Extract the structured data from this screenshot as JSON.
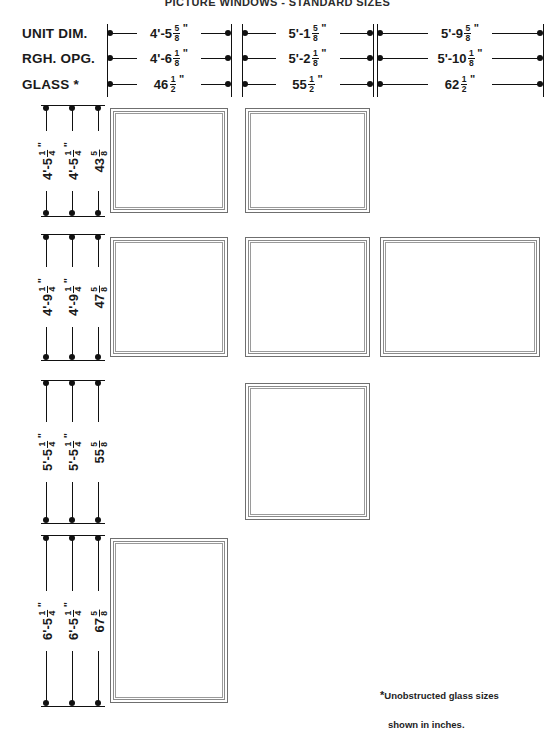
{
  "title": "PICTURE WINDOWS - STANDARD SIZES",
  "row_labels": {
    "unit_dim": "UNIT DIM.",
    "rgh_opg": "RGH. OPG.",
    "glass": "GLASS *"
  },
  "footnote": {
    "star": "*",
    "line1": "Unobstructed glass sizes",
    "line2": "shown in inches."
  },
  "columns": [
    {
      "id": "col-1",
      "unit_dim": {
        "feet": "4'-5",
        "num": "5",
        "den": "8",
        "mark": "\""
      },
      "rgh_opg": {
        "feet": "4'-6",
        "num": "1",
        "den": "8",
        "mark": "\""
      },
      "glass": {
        "feet": "46",
        "num": "1",
        "den": "2",
        "mark": "\""
      }
    },
    {
      "id": "col-2",
      "unit_dim": {
        "feet": "5'-1",
        "num": "5",
        "den": "8",
        "mark": "\""
      },
      "rgh_opg": {
        "feet": "5'-2",
        "num": "1",
        "den": "8",
        "mark": "\""
      },
      "glass": {
        "feet": "55",
        "num": "1",
        "den": "2",
        "mark": "\""
      }
    },
    {
      "id": "col-3",
      "unit_dim": {
        "feet": "5'-9",
        "num": "5",
        "den": "8",
        "mark": "\""
      },
      "rgh_opg": {
        "feet": "5'-10",
        "num": "1",
        "den": "8",
        "mark": "\""
      },
      "glass": {
        "feet": "62",
        "num": "1",
        "den": "2",
        "mark": "\""
      }
    }
  ],
  "rows": [
    {
      "id": "row-1",
      "unit_dim": {
        "feet": "4'-5",
        "num": "1",
        "den": "4",
        "mark": "\""
      },
      "rgh_opg": {
        "feet": "4'-5",
        "num": "1",
        "den": "4",
        "mark": "\""
      },
      "glass": {
        "feet": "43",
        "num": "5",
        "den": "8",
        "mark": ""
      },
      "boxes": [
        true,
        true,
        false
      ]
    },
    {
      "id": "row-2",
      "unit_dim": {
        "feet": "4'-9",
        "num": "1",
        "den": "4",
        "mark": "\""
      },
      "rgh_opg": {
        "feet": "4'-9",
        "num": "1",
        "den": "4",
        "mark": "\""
      },
      "glass": {
        "feet": "47",
        "num": "5",
        "den": "8",
        "mark": ""
      },
      "boxes": [
        true,
        true,
        true
      ]
    },
    {
      "id": "row-3",
      "unit_dim": {
        "feet": "5'-5",
        "num": "1",
        "den": "4",
        "mark": "\""
      },
      "rgh_opg": {
        "feet": "5'-5",
        "num": "1",
        "den": "4",
        "mark": "\""
      },
      "glass": {
        "feet": "55",
        "num": "5",
        "den": "8",
        "mark": ""
      },
      "boxes": [
        false,
        true,
        false
      ]
    },
    {
      "id": "row-4",
      "unit_dim": {
        "feet": "6'-5",
        "num": "1",
        "den": "4",
        "mark": "\""
      },
      "rgh_opg": {
        "feet": "6'-5",
        "num": "1",
        "den": "4",
        "mark": "\""
      },
      "glass": {
        "feet": "67",
        "num": "5",
        "den": "8",
        "mark": ""
      },
      "boxes": [
        true,
        false,
        false
      ]
    }
  ],
  "geometry": {
    "col_x": [
      110,
      245,
      380
    ],
    "col_w": [
      118,
      125,
      160
    ],
    "row_y": [
      108,
      237,
      383,
      538
    ],
    "row_h": [
      105,
      120,
      137,
      165
    ],
    "vline_x": [
      47,
      73,
      99
    ],
    "hline_y": [
      33,
      58,
      84
    ]
  }
}
